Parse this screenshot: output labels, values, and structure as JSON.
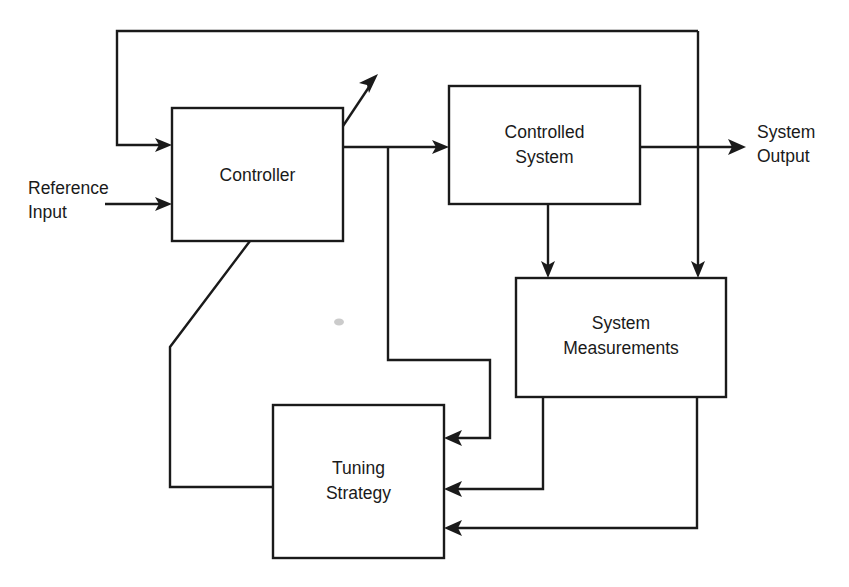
{
  "diagram": {
    "stroke_color": "#1a1a1a",
    "background_color": "#ffffff",
    "blocks": [
      {
        "id": "controller",
        "label_line1": "Controller",
        "label_line2": "",
        "x": 172,
        "y": 108,
        "width": 171,
        "height": 133
      },
      {
        "id": "controlled-system",
        "label_line1": "Controlled",
        "label_line2": "System",
        "x": 449,
        "y": 86,
        "width": 191,
        "height": 118
      },
      {
        "id": "system-measurements",
        "label_line1": "System",
        "label_line2": "Measurements",
        "x": 516,
        "y": 278,
        "width": 210,
        "height": 119
      },
      {
        "id": "tuning-strategy",
        "label_line1": "Tuning",
        "label_line2": "Strategy",
        "x": 273,
        "y": 405,
        "width": 171,
        "height": 153
      }
    ],
    "io_labels": [
      {
        "id": "reference-input",
        "line1": "Reference",
        "line2": "Input",
        "x": 28,
        "y1": 189,
        "y2": 213
      },
      {
        "id": "system-output",
        "line1": "System",
        "line2": "Output",
        "x": 757,
        "y1": 133,
        "y2": 157
      }
    ],
    "connections": [
      {
        "id": "feedback-output-to-controller",
        "from": "system-output-junction",
        "to": "controller",
        "description": "Outer feedback loop from system output back to controller input"
      },
      {
        "id": "reference-input-to-controller",
        "from": "reference-input",
        "to": "controller",
        "description": "Reference input signal into controller"
      },
      {
        "id": "controller-to-controlled-system",
        "from": "controller",
        "to": "controlled-system",
        "description": "Control signal to controlled system"
      },
      {
        "id": "controller-adaptation-out",
        "from": "controller",
        "to": "external",
        "description": "Diagonal adaptation arrow leaving controller"
      },
      {
        "id": "controlled-system-to-output",
        "from": "controlled-system",
        "to": "system-output",
        "description": "Plant output to system output"
      },
      {
        "id": "controlled-system-to-measurements",
        "from": "controlled-system",
        "to": "system-measurements",
        "description": "Plant internal state to system measurements"
      },
      {
        "id": "output-to-measurements",
        "from": "system-output-junction",
        "to": "system-measurements",
        "description": "System output branch into system measurements"
      },
      {
        "id": "controller-branch-to-tuning",
        "from": "controller",
        "to": "tuning-strategy",
        "description": "Control signal branch into tuning strategy"
      },
      {
        "id": "measurements-left-to-tuning",
        "from": "system-measurements",
        "to": "tuning-strategy",
        "description": "Measurement signal into tuning strategy"
      },
      {
        "id": "measurements-right-to-tuning",
        "from": "system-measurements",
        "to": "tuning-strategy",
        "description": "Second measurement signal into tuning strategy"
      },
      {
        "id": "tuning-to-controller",
        "from": "tuning-strategy",
        "to": "controller",
        "description": "Tuning parameters back to controller"
      }
    ]
  }
}
